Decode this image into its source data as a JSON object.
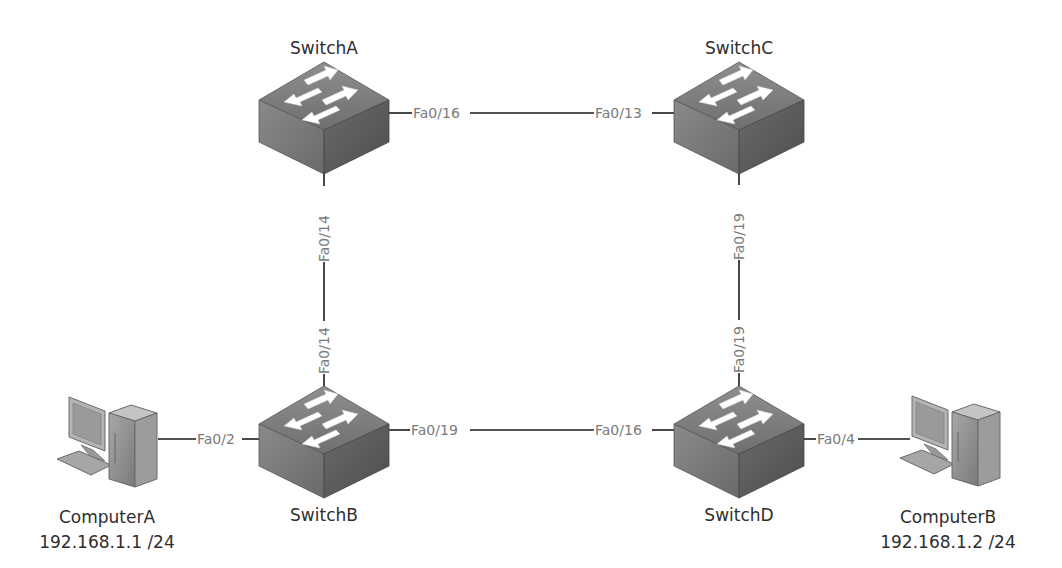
{
  "diagram": {
    "type": "network-topology",
    "nodes": [
      {
        "id": "switchA",
        "kind": "switch",
        "label": "SwitchA"
      },
      {
        "id": "switchB",
        "kind": "switch",
        "label": "SwitchB"
      },
      {
        "id": "switchC",
        "kind": "switch",
        "label": "SwitchC"
      },
      {
        "id": "switchD",
        "kind": "switch",
        "label": "SwitchD"
      },
      {
        "id": "computerA",
        "kind": "computer",
        "label": "ComputerA",
        "ip": "192.168.1.1 /24"
      },
      {
        "id": "computerB",
        "kind": "computer",
        "label": "ComputerB",
        "ip": "192.168.1.2 /24"
      }
    ],
    "links": [
      {
        "from": "switchA",
        "from_port": "Fa0/16",
        "to": "switchC",
        "to_port": "Fa0/13"
      },
      {
        "from": "switchA",
        "from_port": "Fa0/14",
        "to": "switchB",
        "to_port": "Fa0/14"
      },
      {
        "from": "switchC",
        "from_port": "Fa0/19",
        "to": "switchD",
        "to_port": "Fa0/19"
      },
      {
        "from": "switchB",
        "from_port": "Fa0/19",
        "to": "switchD",
        "to_port": "Fa0/16"
      },
      {
        "from": "computerA",
        "from_port": "",
        "to": "switchB",
        "to_port": "Fa0/2"
      },
      {
        "from": "switchD",
        "from_port": "Fa0/4",
        "to": "computerB",
        "to_port": ""
      }
    ],
    "colors": {
      "background": "#ffffff",
      "link": "#1a1a1a",
      "port_label": "#7a7a7a",
      "node_label": "#2e2e2e",
      "switch_top": "#8c8c8c",
      "switch_left": "#7a7a7a",
      "switch_right": "#5e5e5e"
    }
  }
}
